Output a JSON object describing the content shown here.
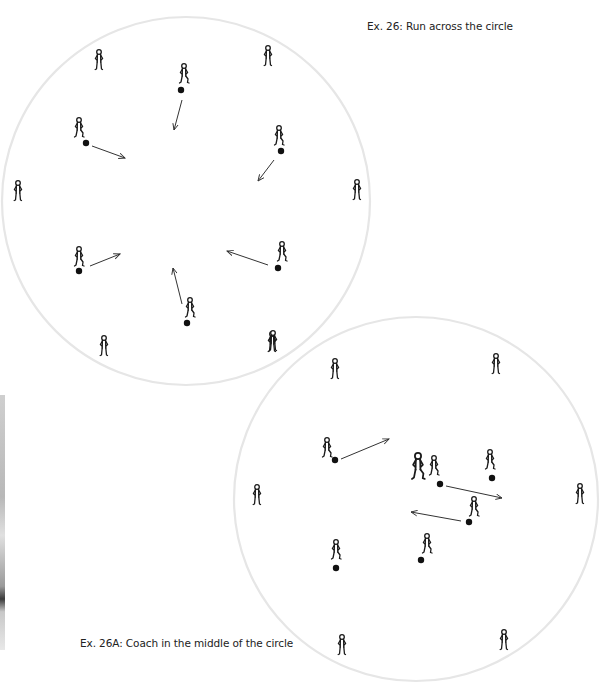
{
  "captions": {
    "exercise_26": "Ex. 26: Run across the circle",
    "exercise_26a": "Ex. 26A: Coach in the middle of the circle"
  },
  "colors": {
    "circle_stroke": "#e6e6e6",
    "figure_stroke": "#1a1a1a",
    "ball_fill": "#111111",
    "arrow_stroke": "#333333",
    "background": "#ffffff"
  },
  "diagrams": [
    {
      "id": "ex26",
      "title": "Ex. 26: Run across the circle",
      "circle": {
        "cx": 186,
        "cy": 201,
        "r": 184
      },
      "outer_players": [
        {
          "x": 99,
          "y": 60
        },
        {
          "x": 268,
          "y": 56
        },
        {
          "x": 18,
          "y": 191
        },
        {
          "x": 357,
          "y": 190
        },
        {
          "x": 104,
          "y": 346
        },
        {
          "x": 272,
          "y": 342
        }
      ],
      "dribblers": [
        {
          "x": 184,
          "y": 76,
          "ball": [
            181,
            90
          ],
          "arrow": [
            [
              182,
              100
            ],
            [
              174,
              130
            ]
          ]
        },
        {
          "x": 79,
          "y": 130,
          "ball": [
            86,
            143
          ],
          "arrow": [
            [
              92,
              146
            ],
            [
              125,
              158
            ]
          ]
        },
        {
          "x": 279,
          "y": 138,
          "ball": [
            281,
            151
          ],
          "arrow": [
            [
              274,
              160
            ],
            [
              258,
              181
            ]
          ]
        },
        {
          "x": 79,
          "y": 259,
          "ball": [
            79,
            271
          ],
          "arrow": [
            [
              90,
              266
            ],
            [
              120,
              254
            ]
          ]
        },
        {
          "x": 282,
          "y": 254,
          "ball": [
            278,
            268
          ],
          "arrow": [
            [
              268,
              265
            ],
            [
              227,
              251
            ]
          ]
        },
        {
          "x": 190,
          "y": 310,
          "ball": [
            187,
            323
          ],
          "arrow": [
            [
              182,
              304
            ],
            [
              173,
              268
            ]
          ]
        }
      ]
    },
    {
      "id": "ex26a",
      "title": "Ex. 26A: Coach in the middle of the circle",
      "circle": {
        "cx": 416,
        "cy": 499,
        "r": 182
      },
      "outer_players": [
        {
          "x": 335,
          "y": 369
        },
        {
          "x": 496,
          "y": 364
        },
        {
          "x": 257,
          "y": 495
        },
        {
          "x": 580,
          "y": 494
        },
        {
          "x": 342,
          "y": 645
        },
        {
          "x": 504,
          "y": 640
        },
        {
          "x": 273,
          "y": 341
        }
      ],
      "coach": {
        "x": 418,
        "y": 470
      },
      "dribblers": [
        {
          "x": 327,
          "y": 450,
          "ball": [
            335,
            460
          ],
          "arrow": [
            [
              341,
              459
            ],
            [
              389,
              439
            ]
          ]
        },
        {
          "x": 434,
          "y": 468,
          "ball": [
            440,
            484
          ],
          "arrow": [
            [
              446,
              486
            ],
            [
              502,
              498
            ]
          ]
        },
        {
          "x": 490,
          "y": 462,
          "ball": [
            492,
            478
          ],
          "arrow": null
        },
        {
          "x": 474,
          "y": 509,
          "ball": [
            469,
            522
          ],
          "arrow": [
            [
              461,
              521
            ],
            [
              411,
              512
            ]
          ]
        },
        {
          "x": 427,
          "y": 546,
          "ball": [
            421,
            560
          ],
          "arrow": null
        },
        {
          "x": 336,
          "y": 552,
          "ball": [
            336,
            568
          ],
          "arrow": null
        }
      ]
    }
  ]
}
